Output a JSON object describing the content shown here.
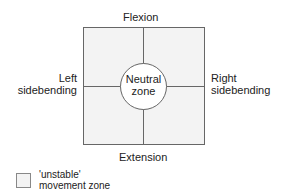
{
  "diagram": {
    "labels": {
      "top": "Flexion",
      "bottom": "Extension",
      "left_line1": "Left",
      "left_line2": "sidebending",
      "right_line1": "Right",
      "right_line2": "sidebending",
      "center_line1": "Neutral",
      "center_line2": "zone"
    },
    "colors": {
      "zone_fill": "#f3f3f3",
      "stroke": "#555555",
      "circle_fill": "#ffffff"
    }
  },
  "legend": {
    "line1": "'unstable'",
    "line2": "movement zone"
  }
}
